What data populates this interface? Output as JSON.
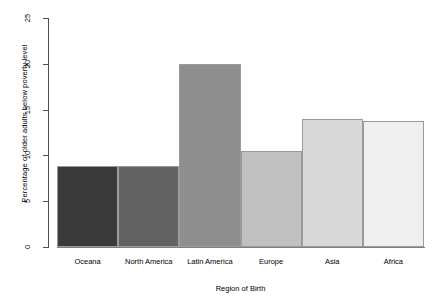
{
  "chart_data": {
    "type": "bar",
    "title": "",
    "xlabel": "Region of Birth",
    "ylabel": "Percentage of older adults below poverty level",
    "categories": [
      "Oceana",
      "North America",
      "Latin America",
      "Europe",
      "Asia",
      "Africa"
    ],
    "values": [
      8.8,
      8.8,
      20.0,
      10.5,
      14.0,
      13.8
    ],
    "bar_colors": [
      "#3a3a3a",
      "#636363",
      "#8e8e8e",
      "#c0c0c0",
      "#d8d8d8",
      "#efefef"
    ],
    "bar_border_color": "#9a9a9a",
    "ylim": [
      0,
      25
    ],
    "yticks": [
      0,
      5,
      10,
      15,
      20,
      25
    ],
    "ytick_labels": [
      "0",
      "5",
      "10",
      "15",
      "20",
      "25"
    ],
    "grid": false,
    "legend": null,
    "axis_color": "#4d4d4d"
  }
}
